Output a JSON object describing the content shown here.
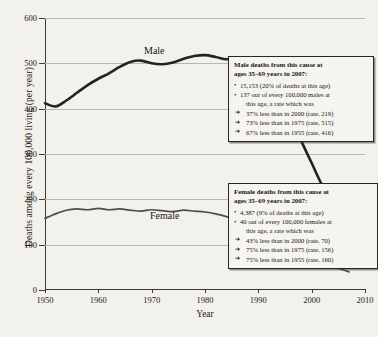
{
  "chart_data": {
    "type": "line",
    "title": "",
    "xlabel": "Year",
    "ylabel": "Deaths among every 100,000 living (per year)",
    "xlim": [
      1950,
      2010
    ],
    "ylim": [
      0,
      600
    ],
    "xticks": [
      "1950",
      "1960",
      "1970",
      "1980",
      "1990",
      "2000",
      "2010"
    ],
    "yticks": [
      "0",
      "100",
      "200",
      "300",
      "400",
      "500",
      "600"
    ],
    "grid": true,
    "legend_position": "inline-labels",
    "series": [
      {
        "name": "Male",
        "x": [
          1950,
          1952,
          1954,
          1956,
          1958,
          1960,
          1962,
          1964,
          1966,
          1968,
          1970,
          1972,
          1974,
          1976,
          1978,
          1980,
          1982,
          1984,
          1986,
          1988,
          1990,
          1992,
          1994,
          1996,
          1998,
          2000,
          2002,
          2004,
          2006,
          2007
        ],
        "values": [
          412,
          405,
          418,
          435,
          452,
          466,
          478,
          492,
          503,
          506,
          500,
          498,
          502,
          510,
          516,
          518,
          514,
          509,
          512,
          508,
          498,
          470,
          430,
          385,
          330,
          280,
          230,
          190,
          155,
          137
        ]
      },
      {
        "name": "Female",
        "x": [
          1950,
          1952,
          1954,
          1956,
          1958,
          1960,
          1962,
          1964,
          1966,
          1968,
          1970,
          1972,
          1974,
          1976,
          1978,
          1980,
          1982,
          1984,
          1986,
          1988,
          1990,
          1992,
          1994,
          1996,
          1998,
          2000,
          2002,
          2004,
          2006,
          2007
        ],
        "values": [
          158,
          168,
          176,
          179,
          177,
          180,
          177,
          179,
          176,
          174,
          177,
          175,
          173,
          176,
          174,
          172,
          168,
          162,
          155,
          145,
          132,
          118,
          103,
          90,
          78,
          70,
          60,
          52,
          44,
          40
        ]
      }
    ]
  },
  "series_labels": {
    "male": "Male",
    "female": "Female"
  },
  "annotations": {
    "male": {
      "heading_line1": "Male deaths from this cause at",
      "heading_line2": "ages 35–69 years in 2007:",
      "bullet1": "15,153 (20% of deaths at this age)",
      "bullet2_line1": "137 out of every 100,000 males at",
      "bullet2_line2": "this age, a rate which was",
      "arrow1": "37% less than in 2000 (rate, 219)",
      "arrow2": "73% less than in 1975 (rate, 515)",
      "arrow3": "67% less than in 1955 (rate, 416)"
    },
    "female": {
      "heading_line1": "Female deaths from this cause at",
      "heading_line2": "ages 35–69 years in 2007:",
      "bullet1": "4,387 (9% of deaths at this age)",
      "bullet2_line1": "40 out of every 100,000 females at",
      "bullet2_line2": "this age, a rate which was",
      "arrow1": "43% less than in 2000 (rate, 70)",
      "arrow2": "75% less than in 1975 (rate, 156)",
      "arrow3": "75% less than in 1955 (rate, 160)"
    }
  },
  "colors": {
    "background": "#f3f1ec",
    "male_line": "#232323",
    "female_line": "#4d4d4d",
    "gridline": "#b9b7b1",
    "axis": "#3b3b3b"
  }
}
